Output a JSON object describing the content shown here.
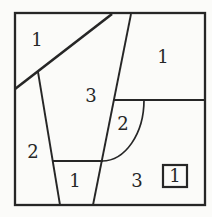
{
  "figure": {
    "ink_color": "#262626",
    "paper_color": "#fbfbf9"
  },
  "regions": {
    "top_left_label": "1",
    "top_right_label": "1",
    "center_label": "3",
    "left_label": "2",
    "arc_label": "2",
    "bottom_center_label": "1",
    "bottom_right_label": "3",
    "inner_square_label": "1"
  }
}
